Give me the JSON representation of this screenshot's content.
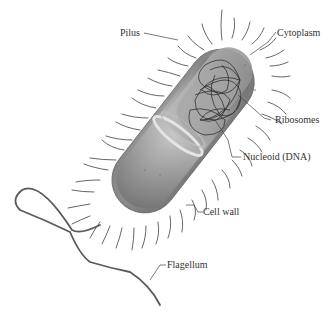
{
  "diagram": {
    "colors": {
      "background": "#ffffff",
      "body_light": "#d8d8d8",
      "body_mid": "#9a9a9a",
      "body_dark": "#5e5e5e",
      "pili": "#555555",
      "flagellum": "#5a5a5a",
      "nucleoid": "#2a2a2a",
      "label_text": "#333333",
      "leader_line": "#444444"
    },
    "labels": [
      {
        "id": "pilus",
        "text": "Pilus"
      },
      {
        "id": "cytoplasm",
        "text": "Cytoplasm"
      },
      {
        "id": "ribosomes",
        "text": "Ribosomes"
      },
      {
        "id": "nucleoid",
        "text": "Nucleoid (DNA)"
      },
      {
        "id": "cell_wall",
        "text": "Cell wall"
      },
      {
        "id": "flagellum",
        "text": "Flagellum"
      }
    ]
  }
}
